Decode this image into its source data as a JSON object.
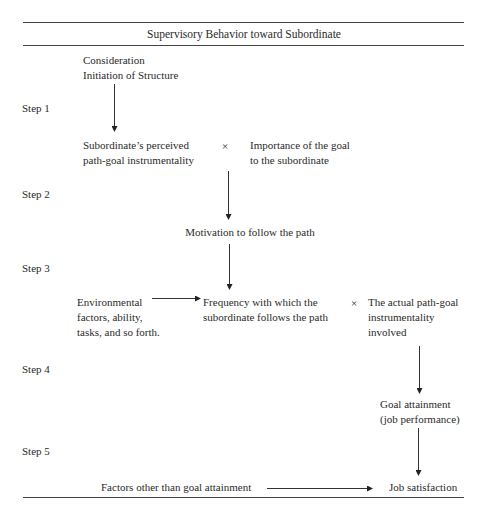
{
  "title": "Supervisory Behavior toward Subordinate",
  "steps": [
    "Step 1",
    "Step 2",
    "Step 3",
    "Step 4",
    "Step 5"
  ],
  "nodes": {
    "behavior_1": "Consideration",
    "behavior_2": "Initiation of Structure",
    "perceived_instrumentality": "Subordinate’s perceived\npath-goal instrumentality",
    "goal_importance": "Importance of the goal\nto the subordinate",
    "motivation": "Motivation to follow the path",
    "environmental": "Environmental\nfactors, ability,\ntasks, and so forth.",
    "frequency": "Frequency with which the\nsubordinate follows the path",
    "actual_instrumentality": "The actual path-goal\ninstrumentality\ninvolved",
    "goal_attainment": "Goal attainment\n(job performance)",
    "other_factors": "Factors other than goal attainment",
    "job_satisfaction": "Job satisfaction"
  },
  "operators": {
    "multiply_step1": "×",
    "multiply_step3": "×"
  },
  "edges": [
    {
      "from": "behavior",
      "to": "perceived_instrumentality"
    },
    {
      "from": "perceived_instrumentality × goal_importance",
      "to": "motivation"
    },
    {
      "from": "motivation",
      "to": "frequency"
    },
    {
      "from": "environmental",
      "to": "frequency"
    },
    {
      "from": "frequency × actual_instrumentality",
      "to": "goal_attainment"
    },
    {
      "from": "goal_attainment",
      "to": "job_satisfaction"
    },
    {
      "from": "other_factors",
      "to": "job_satisfaction"
    }
  ]
}
